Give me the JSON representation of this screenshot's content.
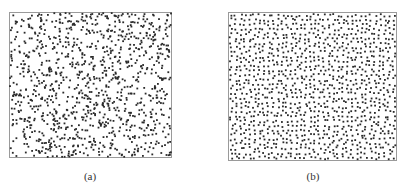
{
  "figure": {
    "panels": [
      {
        "id": "a",
        "caption": "(a)",
        "description": "random (clustered) point distribution",
        "box": {
          "x": 9,
          "y": 12,
          "w": 163,
          "h": 146
        },
        "caption_pos": {
          "x": 70,
          "y": 170
        },
        "point_count": 1100,
        "style": "random",
        "point_color": "#2a2a2a",
        "frame_color": "#9a9a9a"
      },
      {
        "id": "b",
        "caption": "(b)",
        "description": "uniform (blue-noise / Poisson-disk) point distribution",
        "box": {
          "x": 228,
          "y": 12,
          "w": 169,
          "h": 149
        },
        "caption_pos": {
          "x": 293,
          "y": 170
        },
        "point_count": 1150,
        "style": "uniform",
        "point_color": "#2a2a2a",
        "frame_color": "#9a9a9a"
      }
    ]
  }
}
